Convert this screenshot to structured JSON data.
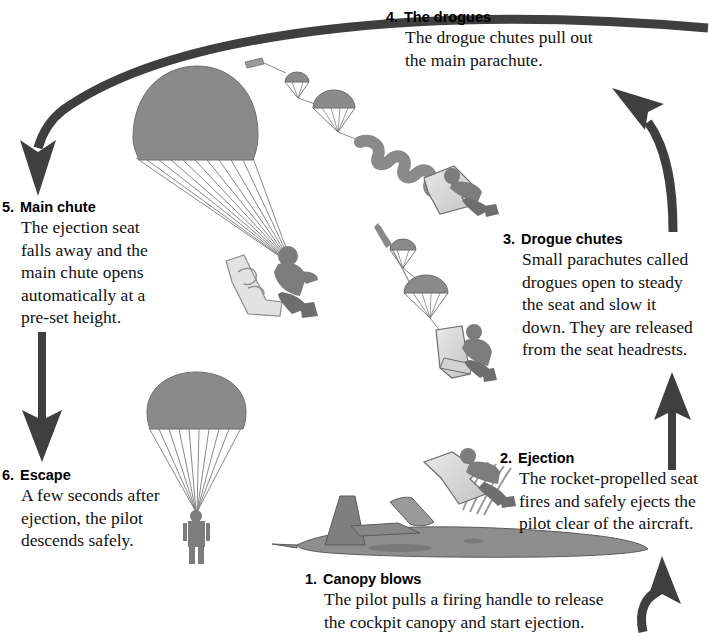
{
  "diagram": {
    "background_color": "#ffffff",
    "ink_color": "#000000",
    "tone_mid_gray": "#8a8a8a",
    "tone_light_gray": "#d9d9d9",
    "tone_dark_gray": "#4a4a4a",
    "arrow_color": "#3a3a3a"
  },
  "steps": [
    {
      "number": "1.",
      "title": "Canopy blows",
      "lines": [
        "The pilot pulls a firing handle to release",
        "the cockpit canopy and start ejection."
      ],
      "illustration": "jet-aircraft-with-ejecting-seat"
    },
    {
      "number": "2.",
      "title": "Ejection",
      "lines": [
        "The rocket-propelled seat",
        "fires and safely ejects the",
        "pilot clear of the aircraft."
      ],
      "illustration": "rocket-seat-rising"
    },
    {
      "number": "3.",
      "title": "Drogue chutes",
      "lines": [
        "Small parachutes called",
        "drogues open to steady",
        "the seat and slow it",
        "down. They are released",
        "from the seat headrests."
      ],
      "illustration": "seat-with-two-drogue-chutes"
    },
    {
      "number": "4.",
      "title": "The drogues",
      "lines": [
        "The drogue chutes pull out",
        "the main parachute."
      ],
      "illustration": "drogues-pulling-main-parachute"
    },
    {
      "number": "5.",
      "title": "Main chute",
      "lines": [
        "The ejection seat",
        "falls away and the",
        "main chute opens",
        "automatically at a",
        "pre-set height."
      ],
      "illustration": "open-main-chute-seat-falling-away"
    },
    {
      "number": "6.",
      "title": "Escape",
      "lines": [
        "A few seconds after",
        "ejection, the pilot",
        "descends safely."
      ],
      "illustration": "pilot-descending-under-chute"
    }
  ],
  "flow_arrows": [
    {
      "name": "arrow-step1-to-step2",
      "direction": "up",
      "shape": "curved-hook-up"
    },
    {
      "name": "arrow-step2-to-step3",
      "direction": "up",
      "shape": "straight-up"
    },
    {
      "name": "arrow-step3-to-step4",
      "direction": "up-left",
      "shape": "curved-up-left"
    },
    {
      "name": "arrow-step4-to-step5",
      "direction": "down-left",
      "shape": "long-curve-down-left"
    },
    {
      "name": "arrow-step5-to-step6",
      "direction": "down",
      "shape": "straight-down"
    }
  ]
}
